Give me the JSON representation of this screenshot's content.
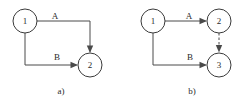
{
  "figure": {
    "background_color": "#ffffff",
    "stroke_color": "#4a4a4a",
    "text_color": "#2b2b2b",
    "width": 252,
    "height": 104
  },
  "diagrams": [
    {
      "id": "a",
      "caption": "a)",
      "caption_x": 61,
      "caption_y": 94,
      "nodes": [
        {
          "id": "a-node-1",
          "label": "1",
          "cx": 25,
          "cy": 21,
          "r": 12
        },
        {
          "id": "a-node-2",
          "label": "2",
          "cx": 90,
          "cy": 65,
          "r": 12
        }
      ],
      "edges": [
        {
          "id": "a-edge-A",
          "label": "A",
          "label_x": 55,
          "label_y": 19,
          "style": "solid",
          "from": "1",
          "to": "2",
          "path": "M 37 21 L 90 21 L 90 51",
          "arrow": {
            "x": 90,
            "y": 53,
            "dir": "down"
          }
        },
        {
          "id": "a-edge-B",
          "label": "B",
          "label_x": 57,
          "label_y": 60,
          "style": "solid",
          "from": "1",
          "to": "2",
          "path": "M 25 33 L 25 65 L 76 65",
          "arrow": {
            "x": 78,
            "y": 65,
            "dir": "right"
          }
        }
      ]
    },
    {
      "id": "b",
      "caption": "b)",
      "caption_x": 192,
      "caption_y": 94,
      "nodes": [
        {
          "id": "b-node-1",
          "label": "1",
          "cx": 153,
          "cy": 21,
          "r": 12
        },
        {
          "id": "b-node-2",
          "label": "2",
          "cx": 219,
          "cy": 21,
          "r": 12
        },
        {
          "id": "b-node-3",
          "label": "3",
          "cx": 219,
          "cy": 65,
          "r": 12
        }
      ],
      "edges": [
        {
          "id": "b-edge-A",
          "label": "A",
          "label_x": 189,
          "label_y": 19,
          "style": "solid",
          "from": "1",
          "to": "2",
          "path": "M 165 21 L 205 21",
          "arrow": {
            "x": 207,
            "y": 21,
            "dir": "right"
          }
        },
        {
          "id": "b-edge-B",
          "label": "B",
          "label_x": 190,
          "label_y": 60,
          "style": "solid",
          "from": "1",
          "to": "3",
          "path": "M 153 33 L 153 65 L 205 65",
          "arrow": {
            "x": 207,
            "y": 65,
            "dir": "right"
          }
        },
        {
          "id": "b-edge-dashed",
          "label": "",
          "label_x": 0,
          "label_y": 0,
          "style": "dashed",
          "from": "2",
          "to": "3",
          "path": "M 219 33 L 219 50",
          "arrow": {
            "x": 219,
            "y": 52,
            "dir": "down"
          }
        }
      ]
    }
  ]
}
